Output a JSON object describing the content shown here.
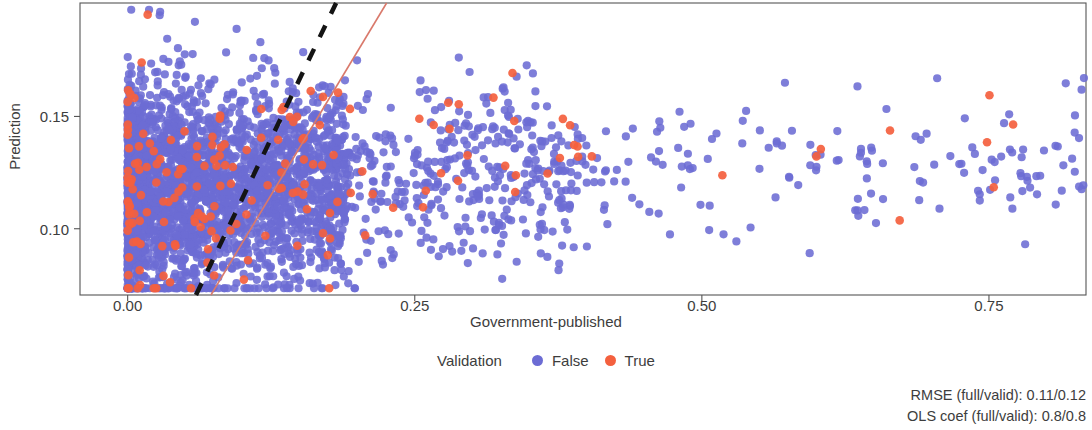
{
  "chart_data": {
    "type": "scatter",
    "title": "",
    "xlabel": "Government-published",
    "ylabel": "Prediction",
    "xticks": [
      "0.00",
      "0.25",
      "0.50",
      "0.75"
    ],
    "xtick_values": [
      0.0,
      0.25,
      0.5,
      0.75
    ],
    "yticks": [
      "0.15",
      "0.10"
    ],
    "ytick_values": [
      0.15,
      0.1
    ],
    "xlim": [
      -0.0415,
      0.8345
    ],
    "ylim": [
      0.0705,
      0.2005
    ],
    "grid": false,
    "legend": {
      "title": "Validation",
      "position": "bottom-center",
      "entries": [
        {
          "label": "False",
          "color": "#6C6CD4"
        },
        {
          "label": "True",
          "color": "#F4603E"
        }
      ]
    },
    "series": [
      {
        "name": "False",
        "color": "#6C6CD4",
        "marker": "circle",
        "point_count": 3400,
        "description": "Dense heteroscedastic cloud: very dense near x=0, fanning out and thinning toward x=0.85; y centred near 0.118"
      },
      {
        "name": "True",
        "color": "#F4603E",
        "marker": "circle",
        "point_count": 185,
        "description": "Sparser overlay of validation points following the same distribution"
      }
    ],
    "reference_lines": [
      {
        "name": "identity-line",
        "style": "dashed",
        "color": "#141414",
        "width": 4.5,
        "x0": 0.0595,
        "y0": 0.0705,
        "x1": 0.1815,
        "y1": 0.2005
      },
      {
        "name": "ols-fit-line",
        "style": "solid",
        "color": "#D9796B",
        "width": 1.6,
        "x0": 0.0725,
        "y0": 0.0705,
        "x1": 0.2255,
        "y1": 0.2005
      }
    ],
    "annotations": [
      "RMSE (full/valid): 0.11/0.12",
      "OLS coef (full/valid): 0.8/0.8"
    ],
    "metrics": {
      "rmse_full": 0.11,
      "rmse_valid": 0.12,
      "ols_coef_full": 0.8,
      "ols_coef_valid": 0.8
    }
  },
  "plot_area": {
    "left": 80,
    "top": 3,
    "right": 1086,
    "bottom": 295,
    "frame_color": "#555555"
  }
}
